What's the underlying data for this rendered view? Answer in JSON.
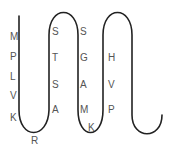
{
  "diagram": {
    "type": "membrane-protein-topology",
    "line_color": "#222222",
    "label_color": "#555555",
    "residues": [
      {
        "label": "M",
        "x": 10,
        "y": 40
      },
      {
        "label": "P",
        "x": 10,
        "y": 60
      },
      {
        "label": "L",
        "x": 10,
        "y": 80
      },
      {
        "label": "V",
        "x": 10,
        "y": 99
      },
      {
        "label": "K",
        "x": 10,
        "y": 121
      },
      {
        "label": "R",
        "x": 31,
        "y": 144
      },
      {
        "label": "S",
        "x": 52,
        "y": 35
      },
      {
        "label": "T",
        "x": 52,
        "y": 61
      },
      {
        "label": "S",
        "x": 52,
        "y": 88
      },
      {
        "label": "A",
        "x": 52,
        "y": 113
      },
      {
        "label": "S",
        "x": 80,
        "y": 35
      },
      {
        "label": "G",
        "x": 80,
        "y": 61
      },
      {
        "label": "A",
        "x": 80,
        "y": 88
      },
      {
        "label": "M",
        "x": 80,
        "y": 113
      },
      {
        "label": "K",
        "x": 88,
        "y": 131
      },
      {
        "label": "H",
        "x": 108,
        "y": 61
      },
      {
        "label": "V",
        "x": 108,
        "y": 88
      },
      {
        "label": "P",
        "x": 108,
        "y": 113
      }
    ]
  }
}
